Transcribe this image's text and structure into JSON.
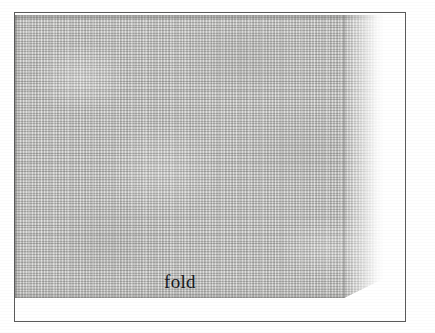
{
  "plate": {
    "kind": "textile-swatch-illustration",
    "background_color": "#ffffff",
    "frame": {
      "border_color": "#5a5a5a",
      "border_width_px": 1,
      "fill_color": "#ffffff"
    },
    "swatch": {
      "material": "woven-linen-cloth",
      "base_color": "#c9c9c7",
      "thread_shadow_color": "#78787a",
      "edge_shadow_color": "#5f5f5d",
      "corner_treatment": "bottom-right-diagonal-cut"
    },
    "crease": {
      "orientation": "vertical",
      "color": "#5c5c5a"
    },
    "right_margin": {
      "description": "lighter washed strip right of the fold fading to paper white",
      "color": "#ffffff"
    }
  },
  "labels": {
    "fold": "fold"
  }
}
